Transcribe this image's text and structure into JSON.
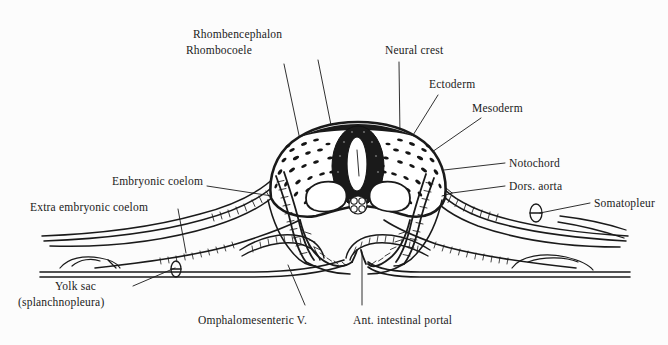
{
  "figure": {
    "type": "anatomical-diagram",
    "background_color": "#fcfcfc",
    "ink_color": "#1a1a1a"
  },
  "labels": {
    "rhombencephalon": "Rhombencephalon",
    "rhombocoele": "Rhombocoele",
    "neural_crest": "Neural crest",
    "ectoderm": "Ectoderm",
    "mesoderm": "Mesoderm",
    "notochord": "Notochord",
    "dors_aorta": "Dors. aorta",
    "somatopleur": "Somatopleur",
    "embryonic_coelom": "Embryonic coelom",
    "extra_embryonic_coelom": "Extra embryonic coelom",
    "yolk_sac_line1": "Yolk sac",
    "yolk_sac_line2": "(splanchnopleura)",
    "omphalomesenteric_v": "Omphalomesenteric V.",
    "ant_intestinal_portal": "Ant. intestinal portal"
  },
  "structures": [
    {
      "name": "neural-tube",
      "description": "dark stippled oval ring, dorsal midline"
    },
    {
      "name": "neural-canal",
      "description": "white slit lumen inside neural tube (rhombocoele)"
    },
    {
      "name": "notochord",
      "description": "small rosette of cells beneath neural tube"
    },
    {
      "name": "dorsal-aorta",
      "description": "paired white cavities lateral to notochord"
    },
    {
      "name": "embryonic-coelom",
      "description": "cavity between somatopleure and splanchnopleure in body"
    },
    {
      "name": "extra-embryonic-coelom",
      "description": "cavity of lateral extra-embryonic membranes"
    },
    {
      "name": "yolk-sac-splanchnopleura",
      "description": "lower membrane sheet of yolk sac"
    },
    {
      "name": "omphalomesenteric-vein",
      "description": "vessel in splanchnopleure"
    },
    {
      "name": "anterior-intestinal-portal",
      "description": "midline opening of foregut at base"
    },
    {
      "name": "somatopleure",
      "description": "outer membrane layer with vessel"
    }
  ]
}
